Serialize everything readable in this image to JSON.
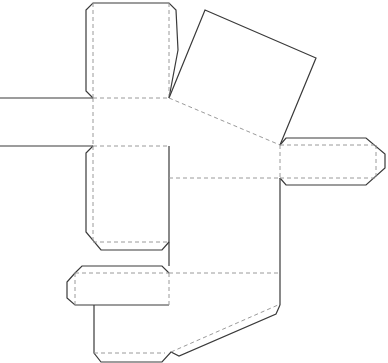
{
  "diagram": {
    "type": "box-net-dieline",
    "colors": {
      "background": "#ffffff",
      "cut_line": "#3a3a3a",
      "fold_line": "#9a9a9a"
    },
    "legend": {
      "cut": "solid line",
      "fold": "dashed line"
    },
    "panels": [
      {
        "name": "top-flap"
      },
      {
        "name": "tilted-square-lid"
      },
      {
        "name": "left-strip"
      },
      {
        "name": "middle-left-flap"
      },
      {
        "name": "right-tab"
      },
      {
        "name": "main-body"
      },
      {
        "name": "bottom-left-tab"
      },
      {
        "name": "bottom-panel"
      }
    ]
  }
}
